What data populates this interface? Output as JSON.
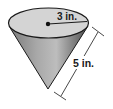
{
  "diagram": {
    "shape": "cone",
    "radius_label": "3 in.",
    "slant_height_label": "5 in.",
    "colors": {
      "top_fill": "#d4d4d4",
      "body_light": "#b8b8b8",
      "body_dark": "#5a5a5a",
      "outline": "#1a1a1a",
      "dimension_line": "#333333"
    }
  }
}
